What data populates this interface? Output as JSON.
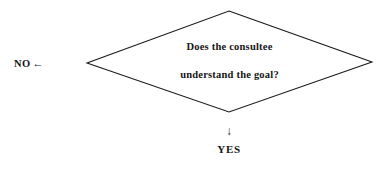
{
  "diagram": {
    "type": "flowchart-decision",
    "background_color": "#ffffff",
    "line_color": "#1a1a1a",
    "text_color": "#161616",
    "decision": {
      "shape": "diamond",
      "line_1": "Does the consultee",
      "line_2": "understand the goal?"
    },
    "branches": {
      "no": {
        "label": "NO",
        "arrow_icon": "arrow-left",
        "arrow_glyph": "←",
        "direction": "left"
      },
      "yes": {
        "label": "YES",
        "arrow_icon": "arrow-down",
        "arrow_glyph": "↓",
        "direction": "down"
      }
    }
  }
}
